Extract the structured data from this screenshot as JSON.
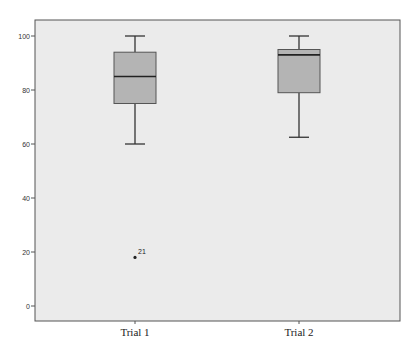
{
  "chart_data": {
    "type": "boxplot",
    "title": "",
    "xlabel": "",
    "ylabel": "",
    "ylim": [
      0,
      100
    ],
    "yticks": [
      0,
      20,
      40,
      60,
      80,
      100
    ],
    "categories": [
      "Trial 1",
      "Trial 2"
    ],
    "grid": false,
    "legend": null,
    "series": [
      {
        "name": "Trial 1",
        "whisker_low": 60,
        "q1": 75,
        "median": 85,
        "q3": 94,
        "whisker_high": 100,
        "outliers": [
          {
            "value": 18,
            "label": "21"
          }
        ]
      },
      {
        "name": "Trial 2",
        "whisker_low": 62.5,
        "q1": 79,
        "median": 93,
        "q3": 95,
        "whisker_high": 100,
        "outliers": []
      }
    ]
  },
  "style": {
    "plot_background": "#ebebeb",
    "frame_color": "#555555",
    "box_fill": "#b4b4b4",
    "line_color": "#333333"
  }
}
